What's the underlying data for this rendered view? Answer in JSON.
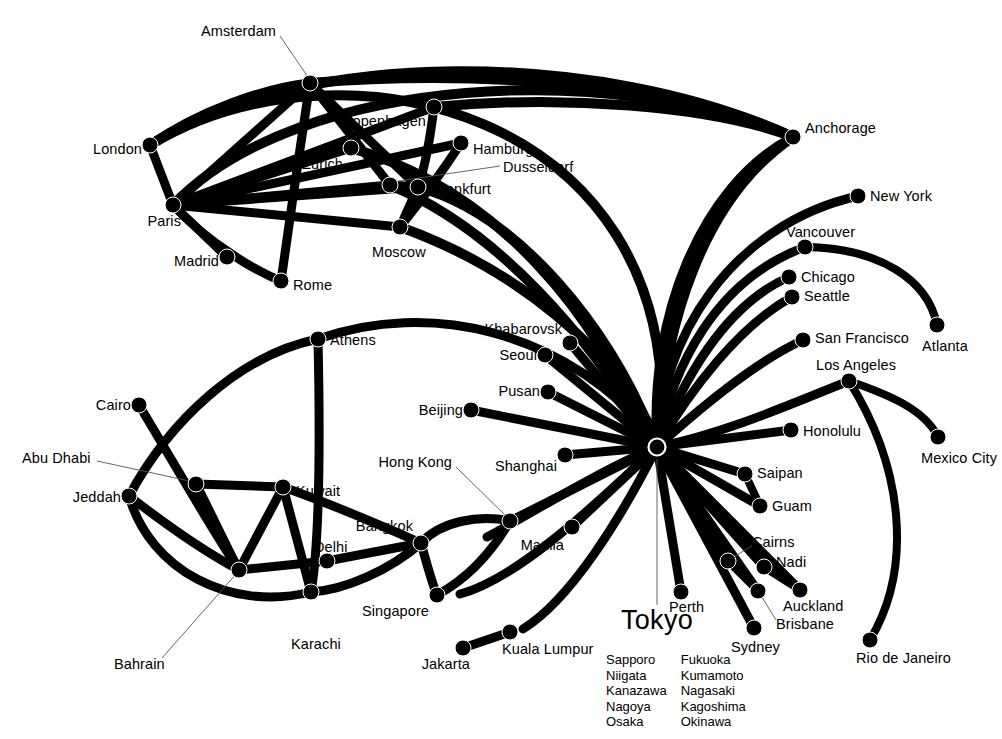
{
  "diagram": {
    "type": "airline-route-network-map",
    "hub": {
      "name": "Tokyo",
      "x": 657,
      "y": 447,
      "label_x": 657,
      "label_y": 623
    },
    "domestic_destinations": {
      "column_1": [
        "Sapporo",
        "Niigata",
        "Kanazawa",
        "Nagoya",
        "Osaka"
      ],
      "column_2": [
        "Fukuoka",
        "Kumamoto",
        "Nagasaki",
        "Kagoshima",
        "Okinawa"
      ],
      "list_x": 606,
      "list_y": 652
    },
    "colors": {
      "route": "#000000",
      "node": "#000000",
      "background": "#ffffff",
      "leader": "#555555"
    },
    "cities": [
      {
        "id": "amsterdam",
        "name": "Amsterdam",
        "x": 310,
        "y": 83,
        "lx": 276,
        "ly": 32,
        "anchor": "r",
        "leader": [
          [
            280,
            36
          ],
          [
            310,
            80
          ]
        ]
      },
      {
        "id": "london",
        "name": "London",
        "x": 150,
        "y": 145,
        "lx": 142,
        "ly": 150,
        "anchor": "r"
      },
      {
        "id": "copenhagen",
        "name": "Copenhagen",
        "x": 434,
        "y": 107,
        "lx": 426,
        "ly": 122,
        "anchor": "r"
      },
      {
        "id": "zurich",
        "name": "Zurich",
        "x": 351,
        "y": 148,
        "lx": 343,
        "ly": 165,
        "anchor": "r"
      },
      {
        "id": "hamburg",
        "name": "Hamburg",
        "x": 461,
        "y": 143,
        "lx": 473,
        "ly": 150,
        "anchor": "l"
      },
      {
        "id": "dusseldorf",
        "name": "Dusseldorf",
        "x": 390,
        "y": 185,
        "lx": 503,
        "ly": 168,
        "anchor": "l",
        "leader": [
          [
            500,
            166
          ],
          [
            392,
            182
          ]
        ]
      },
      {
        "id": "frankfurt",
        "name": "Frankfurt",
        "x": 418,
        "y": 187,
        "lx": 432,
        "ly": 190,
        "anchor": "l"
      },
      {
        "id": "paris",
        "name": "Paris",
        "x": 173,
        "y": 205,
        "lx": 181,
        "ly": 222,
        "anchor": "r"
      },
      {
        "id": "madrid",
        "name": "Madrid",
        "x": 227,
        "y": 257,
        "lx": 219,
        "ly": 262,
        "anchor": "r"
      },
      {
        "id": "rome",
        "name": "Rome",
        "x": 281,
        "y": 281,
        "lx": 293,
        "ly": 286,
        "anchor": "l"
      },
      {
        "id": "moscow",
        "name": "Moscow",
        "x": 400,
        "y": 227,
        "lx": 372,
        "ly": 253,
        "anchor": "l"
      },
      {
        "id": "anchorage",
        "name": "Anchorage",
        "x": 793,
        "y": 137,
        "lx": 805,
        "ly": 129,
        "anchor": "l"
      },
      {
        "id": "newyork",
        "name": "New York",
        "x": 858,
        "y": 196,
        "lx": 870,
        "ly": 197,
        "anchor": "l"
      },
      {
        "id": "vancouver",
        "name": "Vancouver",
        "x": 805,
        "y": 247,
        "lx": 786,
        "ly": 233,
        "anchor": "l"
      },
      {
        "id": "chicago",
        "name": "Chicago",
        "x": 789,
        "y": 277,
        "lx": 801,
        "ly": 278,
        "anchor": "l"
      },
      {
        "id": "seattle",
        "name": "Seattle",
        "x": 792,
        "y": 297,
        "lx": 804,
        "ly": 297,
        "anchor": "l"
      },
      {
        "id": "sanfrancisco",
        "name": "San Francisco",
        "x": 803,
        "y": 340,
        "lx": 815,
        "ly": 339,
        "anchor": "l"
      },
      {
        "id": "atlanta",
        "name": "Atlanta",
        "x": 937,
        "y": 325,
        "lx": 922,
        "ly": 347,
        "anchor": "l"
      },
      {
        "id": "losangeles",
        "name": "Los Angeles",
        "x": 849,
        "y": 381,
        "lx": 816,
        "ly": 366,
        "anchor": "l"
      },
      {
        "id": "honolulu",
        "name": "Honolulu",
        "x": 791,
        "y": 430,
        "lx": 803,
        "ly": 432,
        "anchor": "l"
      },
      {
        "id": "mexicocity",
        "name": "Mexico City",
        "x": 938,
        "y": 437,
        "lx": 921,
        "ly": 459,
        "anchor": "l"
      },
      {
        "id": "riodejaneiro",
        "name": "Rio de Janeiro",
        "x": 870,
        "y": 640,
        "lx": 856,
        "ly": 659,
        "anchor": "l"
      },
      {
        "id": "khabarovsk",
        "name": "Khabarovsk",
        "x": 570,
        "y": 343,
        "lx": 562,
        "ly": 330,
        "anchor": "r"
      },
      {
        "id": "seoul",
        "name": "Seoul",
        "x": 545,
        "y": 355,
        "lx": 537,
        "ly": 356,
        "anchor": "r"
      },
      {
        "id": "pusan",
        "name": "Pusan",
        "x": 548,
        "y": 392,
        "lx": 540,
        "ly": 392,
        "anchor": "r"
      },
      {
        "id": "beijing",
        "name": "Beijing",
        "x": 471,
        "y": 410,
        "lx": 463,
        "ly": 411,
        "anchor": "r"
      },
      {
        "id": "shanghai",
        "name": "Shanghai",
        "x": 565,
        "y": 455,
        "lx": 557,
        "ly": 467,
        "anchor": "r"
      },
      {
        "id": "hongkong",
        "name": "Hong Kong",
        "x": 510,
        "y": 521,
        "lx": 452,
        "ly": 463,
        "anchor": "r",
        "leader": [
          [
            456,
            467
          ],
          [
            508,
            518
          ]
        ]
      },
      {
        "id": "manila",
        "name": "Manila",
        "x": 572,
        "y": 527,
        "lx": 564,
        "ly": 546,
        "anchor": "r"
      },
      {
        "id": "bangkok",
        "name": "Bangkok",
        "x": 421,
        "y": 543,
        "lx": 413,
        "ly": 527,
        "anchor": "r"
      },
      {
        "id": "singapore",
        "name": "Singapore",
        "x": 437,
        "y": 595,
        "lx": 429,
        "ly": 612,
        "anchor": "r"
      },
      {
        "id": "kualalumpur",
        "name": "Kuala Lumpur",
        "x": 510,
        "y": 632,
        "lx": 502,
        "ly": 650,
        "anchor": "l"
      },
      {
        "id": "jakarta",
        "name": "Jakarta",
        "x": 463,
        "y": 648,
        "lx": 470,
        "ly": 665,
        "anchor": "r"
      },
      {
        "id": "athens",
        "name": "Athens",
        "x": 318,
        "y": 339,
        "lx": 330,
        "ly": 341,
        "anchor": "l"
      },
      {
        "id": "cairo",
        "name": "Cairo",
        "x": 139,
        "y": 405,
        "lx": 131,
        "ly": 406,
        "anchor": "r"
      },
      {
        "id": "abudhabi",
        "name": "Abu Dhabi",
        "x": 196,
        "y": 484,
        "lx": 22,
        "ly": 459,
        "anchor": "l",
        "leader": [
          [
            97,
            461
          ],
          [
            194,
            482
          ]
        ]
      },
      {
        "id": "jeddah",
        "name": "Jeddah",
        "x": 129,
        "y": 496,
        "lx": 121,
        "ly": 498,
        "anchor": "r"
      },
      {
        "id": "kuwait",
        "name": "Kuwait",
        "x": 283,
        "y": 487,
        "lx": 296,
        "ly": 492,
        "anchor": "l"
      },
      {
        "id": "bahrain",
        "name": "Bahrain",
        "x": 239,
        "y": 570,
        "lx": 114,
        "ly": 665,
        "anchor": "l",
        "leader": [
          [
            162,
            658
          ],
          [
            237,
            573
          ]
        ]
      },
      {
        "id": "delhi",
        "name": "Delhi",
        "x": 327,
        "y": 561,
        "lx": 314,
        "ly": 548,
        "anchor": "l"
      },
      {
        "id": "karachi",
        "name": "Karachi",
        "x": 311,
        "y": 592,
        "lx": 291,
        "ly": 645,
        "anchor": "l"
      },
      {
        "id": "saipan",
        "name": "Saipan",
        "x": 745,
        "y": 474,
        "lx": 757,
        "ly": 474,
        "anchor": "l"
      },
      {
        "id": "guam",
        "name": "Guam",
        "x": 760,
        "y": 506,
        "lx": 772,
        "ly": 507,
        "anchor": "l"
      },
      {
        "id": "cairns",
        "name": "Cairns",
        "x": 728,
        "y": 561,
        "lx": 752,
        "ly": 543,
        "anchor": "l",
        "leader": [
          [
            752,
            546
          ],
          [
            730,
            559
          ]
        ]
      },
      {
        "id": "nadi",
        "name": "Nadi",
        "x": 764,
        "y": 567,
        "lx": 776,
        "ly": 563,
        "anchor": "l"
      },
      {
        "id": "brisbane",
        "name": "Brisbane",
        "x": 758,
        "y": 591,
        "lx": 776,
        "ly": 625,
        "anchor": "l",
        "leader": [
          [
            776,
            620
          ],
          [
            760,
            594
          ]
        ]
      },
      {
        "id": "auckland",
        "name": "Auckland",
        "x": 800,
        "y": 590,
        "lx": 783,
        "ly": 607,
        "anchor": "l"
      },
      {
        "id": "perth",
        "name": "Perth",
        "x": 681,
        "y": 592,
        "lx": 669,
        "ly": 608,
        "anchor": "l"
      },
      {
        "id": "sydney",
        "name": "Sydney",
        "x": 754,
        "y": 628,
        "lx": 731,
        "ly": 648,
        "anchor": "l"
      }
    ],
    "routes": [
      {
        "from": "tokyo",
        "to": "khabarovsk",
        "w": 9,
        "path": "M657,447 L570,343"
      },
      {
        "from": "tokyo",
        "to": "seoul",
        "w": 9,
        "path": "M657,447 L545,355"
      },
      {
        "from": "tokyo",
        "to": "pusan",
        "w": 9,
        "path": "M657,447 L548,392"
      },
      {
        "from": "tokyo",
        "to": "beijing",
        "w": 9,
        "path": "M657,447 L471,410"
      },
      {
        "from": "tokyo",
        "to": "shanghai",
        "w": 9,
        "path": "M657,447 L565,455"
      },
      {
        "from": "tokyo",
        "to": "hongkong",
        "w": 9,
        "path": "M657,447 L510,521"
      },
      {
        "from": "tokyo",
        "to": "manila",
        "w": 9,
        "path": "M657,447 L572,527"
      },
      {
        "from": "tokyo",
        "to": "bangkok",
        "w": 9,
        "path": "M657,447 C600,470 520,520 487,537"
      },
      {
        "from": "tokyo",
        "to": "singapore",
        "w": 9,
        "path": "M657,447 C600,500 520,578 460,594"
      },
      {
        "from": "tokyo",
        "to": "kualalumpur",
        "w": 9,
        "path": "M657,447 C620,520 570,600 523,629"
      },
      {
        "from": "tokyo",
        "to": "perth",
        "w": 9,
        "path": "M657,447 L681,592"
      },
      {
        "from": "tokyo",
        "to": "sydney",
        "w": 9,
        "path": "M657,447 L754,628"
      },
      {
        "from": "tokyo",
        "to": "brisbane",
        "w": 9,
        "path": "M657,447 L758,591"
      },
      {
        "from": "tokyo",
        "to": "cairns",
        "w": 9,
        "path": "M657,447 L728,561"
      },
      {
        "from": "tokyo",
        "to": "nadi",
        "w": 9,
        "path": "M657,447 L764,567"
      },
      {
        "from": "tokyo",
        "to": "auckland",
        "w": 9,
        "path": "M657,447 L800,590"
      },
      {
        "from": "tokyo",
        "to": "guam",
        "w": 9,
        "path": "M657,447 L760,506"
      },
      {
        "from": "tokyo",
        "to": "saipan",
        "w": 9,
        "path": "M657,447 L745,474"
      },
      {
        "from": "tokyo",
        "to": "honolulu",
        "w": 9,
        "path": "M657,447 L791,430"
      },
      {
        "from": "tokyo",
        "to": "losangeles",
        "w": 9,
        "path": "M657,447 C730,432 800,400 849,381"
      },
      {
        "from": "tokyo",
        "to": "sanfrancisco",
        "w": 9,
        "path": "M657,447 C700,408 755,362 803,340"
      },
      {
        "from": "tokyo",
        "to": "seattle",
        "w": 9,
        "path": "M657,447 C690,390 740,325 792,297"
      },
      {
        "from": "tokyo",
        "to": "chicago",
        "w": 9,
        "path": "M657,447 C683,380 725,305 789,277"
      },
      {
        "from": "tokyo",
        "to": "vancouver",
        "w": 9,
        "path": "M657,447 C672,368 715,280 805,247"
      },
      {
        "from": "tokyo",
        "to": "newyork",
        "w": 9,
        "path": "M657,447 C660,340 730,225 858,196"
      },
      {
        "from": "tokyo",
        "to": "anchorage",
        "w": 9,
        "path": "M657,447 C648,320 700,185 793,137"
      },
      {
        "from": "losangeles",
        "to": "mexicocity",
        "w": 8,
        "path": "M849,381 C890,395 925,410 938,437"
      },
      {
        "from": "losangeles",
        "to": "riodejaneiro",
        "w": 8,
        "path": "M849,381 C905,470 912,570 870,640"
      },
      {
        "from": "vancouver",
        "to": "atlanta",
        "w": 8,
        "path": "M805,247 C880,248 928,280 937,325"
      },
      {
        "from": "saipan",
        "to": "guam",
        "w": 8,
        "path": "M745,474 L760,506"
      },
      {
        "from": "cairns",
        "to": "brisbane",
        "w": 8,
        "path": "M728,561 L758,591"
      },
      {
        "from": "nadi",
        "to": "auckland",
        "w": 8,
        "path": "M764,567 L800,590"
      },
      {
        "from": "hongkong",
        "to": "bangkok",
        "w": 9,
        "path": "M510,521 C478,514 440,522 421,543"
      },
      {
        "from": "hongkong",
        "to": "singapore",
        "w": 9,
        "path": "M510,521 C490,555 465,580 437,595"
      },
      {
        "from": "bangkok",
        "to": "singapore",
        "w": 9,
        "path": "M421,543 C427,565 432,583 437,595"
      },
      {
        "from": "bangkok",
        "to": "delhi",
        "w": 9,
        "path": "M421,543 L327,561"
      },
      {
        "from": "bangkok",
        "to": "karachi",
        "w": 9,
        "path": "M421,543 C390,570 345,590 311,592"
      },
      {
        "from": "bangkok",
        "to": "kuwait",
        "w": 9,
        "path": "M421,543 C380,525 320,500 283,487"
      },
      {
        "from": "jakarta",
        "to": "kualalumpur",
        "w": 9,
        "path": "M463,648 L510,632"
      },
      {
        "from": "delhi",
        "to": "bahrain",
        "w": 9,
        "path": "M327,561 L239,570"
      },
      {
        "from": "kuwait",
        "to": "bahrain",
        "w": 9,
        "path": "M283,487 L239,570"
      },
      {
        "from": "kuwait",
        "to": "karachi",
        "w": 9,
        "path": "M283,487 L311,592"
      },
      {
        "from": "kuwait",
        "to": "abudhabi",
        "w": 9,
        "path": "M283,487 L196,484"
      },
      {
        "from": "abudhabi",
        "to": "bahrain",
        "w": 9,
        "path": "M196,484 C212,515 228,550 239,570"
      },
      {
        "from": "jeddah",
        "to": "bahrain",
        "w": 9,
        "path": "M129,496 C160,520 205,552 239,570"
      },
      {
        "from": "jeddah",
        "to": "karachi",
        "w": 9,
        "path": "M129,496 C150,570 230,612 311,592"
      },
      {
        "from": "jeddah",
        "to": "athens",
        "w": 9,
        "path": "M129,496 C170,420 240,355 318,339"
      },
      {
        "from": "cairo",
        "to": "bahrain",
        "w": 9,
        "path": "M139,405 C175,465 215,535 239,570"
      },
      {
        "from": "athens",
        "to": "karachi",
        "w": 9,
        "path": "M318,339 C320,430 320,540 311,592"
      },
      {
        "from": "london",
        "to": "amsterdam",
        "w": 9,
        "path": "M150,145 C200,110 265,88 310,83"
      },
      {
        "from": "london",
        "to": "paris",
        "w": 9,
        "path": "M150,145 L173,205"
      },
      {
        "from": "london",
        "to": "anchorage",
        "w": 10,
        "path": "M150,145 C300,48 600,48 793,137"
      },
      {
        "from": "paris",
        "to": "amsterdam",
        "w": 9,
        "path": "M173,205 L310,83"
      },
      {
        "from": "paris",
        "to": "copenhagen",
        "w": 9,
        "path": "M173,205 L434,107"
      },
      {
        "from": "paris",
        "to": "hamburg",
        "w": 9,
        "path": "M173,205 L461,143"
      },
      {
        "from": "paris",
        "to": "zurich",
        "w": 9,
        "path": "M173,205 L351,148"
      },
      {
        "from": "paris",
        "to": "frankfurt",
        "w": 9,
        "path": "M173,205 L418,187"
      },
      {
        "from": "paris",
        "to": "dusseldorf",
        "w": 9,
        "path": "M173,205 L390,185"
      },
      {
        "from": "paris",
        "to": "moscow",
        "w": 9,
        "path": "M173,205 L400,227"
      },
      {
        "from": "paris",
        "to": "madrid",
        "w": 9,
        "path": "M173,205 L227,257"
      },
      {
        "from": "paris",
        "to": "rome",
        "w": 9,
        "path": "M173,205 C210,245 258,272 281,281"
      },
      {
        "from": "paris",
        "to": "anchorage",
        "w": 10,
        "path": "M173,205 C300,72 620,62 793,137"
      },
      {
        "from": "amsterdam",
        "to": "rome",
        "w": 9,
        "path": "M310,83 C298,160 287,240 281,281"
      },
      {
        "from": "amsterdam",
        "to": "frankfurt",
        "w": 9,
        "path": "M310,83 L418,187"
      },
      {
        "from": "amsterdam",
        "to": "dusseldorf",
        "w": 9,
        "path": "M310,83 L390,185"
      },
      {
        "from": "amsterdam",
        "to": "anchorage",
        "w": 10,
        "path": "M310,83 C470,70 680,82 793,137"
      },
      {
        "from": "copenhagen",
        "to": "anchorage",
        "w": 10,
        "path": "M434,107 C560,95 710,105 793,137"
      },
      {
        "from": "copenhagen",
        "to": "frankfurt",
        "w": 9,
        "path": "M434,107 C430,140 424,170 418,187"
      },
      {
        "from": "hamburg",
        "to": "moscow",
        "w": 9,
        "path": "M461,143 C440,175 412,212 400,227"
      },
      {
        "from": "moscow",
        "to": "frankfurt",
        "w": 9,
        "path": "M400,227 L418,187"
      },
      {
        "from": "frankfurt",
        "to": "dusseldorf",
        "w": 9,
        "path": "M418,187 L390,185"
      },
      {
        "from": "frankfurt",
        "to": "tokyo",
        "w": 10,
        "path": "M418,187 C520,215 610,330 650,430"
      },
      {
        "from": "dusseldorf",
        "to": "tokyo",
        "w": 10,
        "path": "M390,185 C500,230 590,340 646,432"
      },
      {
        "from": "zurich",
        "to": "tokyo",
        "w": 10,
        "path": "M351,148 C500,190 600,320 644,434"
      },
      {
        "from": "moscow",
        "to": "tokyo",
        "w": 10,
        "path": "M400,227 C520,270 610,350 652,430"
      },
      {
        "from": "anchorage",
        "to": "tokyo",
        "w": 10,
        "path": "M793,137 C700,200 665,330 659,430"
      },
      {
        "from": "london",
        "to": "tokyo",
        "w": 10,
        "path": "M150,145 C340,30 680,110 661,430"
      },
      {
        "from": "athens",
        "to": "tokyo",
        "w": 9,
        "path": "M318,339 C430,300 560,330 650,432"
      }
    ]
  }
}
